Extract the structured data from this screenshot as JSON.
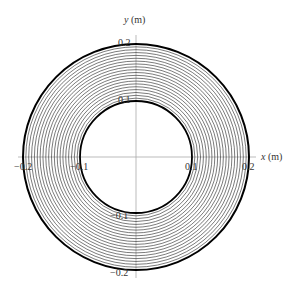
{
  "diagram": {
    "type": "concentric-ring-contours",
    "x_axis_label": "x (m)",
    "x_axis_var": "x",
    "x_axis_unit": "(m)",
    "y_axis_label": "y (m)",
    "y_axis_var": "y",
    "y_axis_unit": "(m)",
    "x_ticks": [
      "−0.2",
      "−0.1",
      "0.1",
      "0.2"
    ],
    "y_ticks": [
      "0.2",
      "0.1",
      "−0.1",
      "−0.2"
    ],
    "inner_radius_m": 0.1,
    "outer_radius_m": 0.2,
    "contour_count": 19,
    "colors": {
      "contour": "#222222",
      "boundary": "#000000",
      "axis": "#999999",
      "text": "#333333"
    }
  }
}
